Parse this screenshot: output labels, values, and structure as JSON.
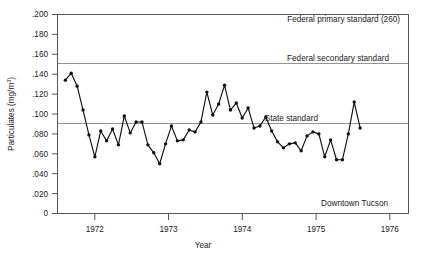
{
  "chart_data": {
    "type": "line",
    "title": "",
    "subtitle": "",
    "xlabel": "Year",
    "ylabel": "Particulates (mg/m³)",
    "ylim": [
      0,
      0.2
    ],
    "xlim": [
      1971.5,
      1976.25
    ],
    "grid": false,
    "legend": "none",
    "y_ticks": [
      0.2,
      0.18,
      0.16,
      0.14,
      0.12,
      0.1,
      0.08,
      0.06,
      0.04,
      0.02,
      0
    ],
    "y_tick_labels": [
      ".200",
      ".180",
      ".160",
      ".140",
      ".120",
      ".100",
      ".080",
      ".060",
      ".040",
      ".020",
      "0"
    ],
    "x_ticks": [
      1972,
      1973,
      1974,
      1975,
      1976
    ],
    "x_tick_labels": [
      "1972",
      "1973",
      "1974",
      "1975",
      "1976"
    ],
    "series": [
      {
        "name": "Downtown Tucson particulates",
        "x": [
          1971.6,
          1971.68,
          1971.76,
          1971.84,
          1971.92,
          1972.0,
          1972.08,
          1972.16,
          1972.24,
          1972.32,
          1972.4,
          1972.48,
          1972.56,
          1972.64,
          1972.72,
          1972.8,
          1972.88,
          1972.96,
          1973.04,
          1973.12,
          1973.2,
          1973.28,
          1973.36,
          1973.44,
          1973.52,
          1973.6,
          1973.68,
          1973.76,
          1973.84,
          1973.92,
          1974.0,
          1974.08,
          1974.16,
          1974.24,
          1974.32,
          1974.4,
          1974.48,
          1974.56,
          1974.64,
          1974.72,
          1974.8,
          1974.88,
          1974.96,
          1975.04,
          1975.12,
          1975.2,
          1975.28,
          1975.36,
          1975.44,
          1975.52,
          1975.6
        ],
        "values": [
          0.134,
          0.141,
          0.128,
          0.104,
          0.079,
          0.057,
          0.083,
          0.073,
          0.085,
          0.069,
          0.098,
          0.081,
          0.092,
          0.092,
          0.069,
          0.061,
          0.05,
          0.07,
          0.088,
          0.073,
          0.074,
          0.084,
          0.082,
          0.092,
          0.122,
          0.099,
          0.11,
          0.129,
          0.104,
          0.111,
          0.096,
          0.106,
          0.086,
          0.088,
          0.097,
          0.083,
          0.072,
          0.066,
          0.07,
          0.071,
          0.063,
          0.078,
          0.082,
          0.08,
          0.057,
          0.074,
          0.054,
          0.054,
          0.08,
          0.112,
          0.086
        ]
      }
    ],
    "reference_lines": [
      {
        "id": "federal-primary",
        "label": "Federal primary standard (260)",
        "value": 0.26,
        "drawn_at_y": 0.2,
        "note": "label sits just inside top frame"
      },
      {
        "id": "federal-secondary",
        "label": "Federal secondary standard",
        "value": 0.15
      },
      {
        "id": "state",
        "label": "State standard",
        "value": 0.1
      }
    ],
    "annotations": [
      {
        "id": "location",
        "text": "Downtown Tucson",
        "value_y": 0.022,
        "value_x": 1975.45
      }
    ],
    "colors": {
      "line": "#111111",
      "marker": "#111111",
      "frame": "#555555",
      "reference_line": "#888888",
      "text": "#1a1a1a",
      "background": "#ffffff"
    }
  },
  "labels": {
    "ylabel_main": "Particulates (mg/m",
    "ylabel_sup": "3",
    "ylabel_close": ")"
  }
}
